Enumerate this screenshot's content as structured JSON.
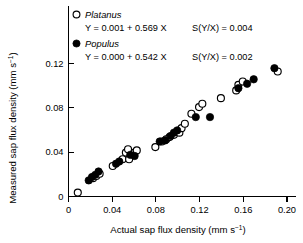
{
  "chart_data": {
    "type": "scatter",
    "title": "",
    "xlabel": "Actual sap flux density (mm s-1)",
    "xlabel_main": "Actual sap flux density (mm s",
    "xlabel_sup": "−1",
    "xlabel_tail": ")",
    "ylabel_main": "Measured sap flux density (mm s",
    "ylabel_sup": "−1",
    "ylabel_tail": ")",
    "xlim": [
      0,
      0.205
    ],
    "ylim": [
      0,
      0.14
    ],
    "xticks": [
      0,
      0.04,
      0.08,
      0.12,
      0.16,
      0.2
    ],
    "xtick_labels": [
      "0",
      "0.04",
      "0.08",
      "0.12",
      "0.16",
      "0.20"
    ],
    "yticks": [
      0,
      0.04,
      0.08,
      0.12
    ],
    "ytick_labels": [
      "0",
      "0.04",
      "0.08",
      "0.12"
    ],
    "grid": false,
    "legend_position": "top-left-inside",
    "series": [
      {
        "name": "Platanus",
        "marker": "open-circle",
        "color": "#000000",
        "fill": "#ffffff",
        "equation": "Y = 0.001 + 0.569 X",
        "intercept": 0.001,
        "slope": 0.569,
        "sy_x_label": "S(Y/X) = 0.004",
        "sy_x": 0.004,
        "points": [
          [
            0.0085,
            0.0035
          ],
          [
            0.0225,
            0.0165
          ],
          [
            0.0255,
            0.0185
          ],
          [
            0.0285,
            0.0205
          ],
          [
            0.0405,
            0.0275
          ],
          [
            0.0495,
            0.0335
          ],
          [
            0.0525,
            0.0395
          ],
          [
            0.0545,
            0.0425
          ],
          [
            0.0555,
            0.0335
          ],
          [
            0.0605,
            0.0395
          ],
          [
            0.0625,
            0.0415
          ],
          [
            0.0795,
            0.0445
          ],
          [
            0.0855,
            0.0495
          ],
          [
            0.0895,
            0.0515
          ],
          [
            0.0925,
            0.0535
          ],
          [
            0.0965,
            0.0555
          ],
          [
            0.1015,
            0.0575
          ],
          [
            0.1035,
            0.0615
          ],
          [
            0.1065,
            0.0655
          ],
          [
            0.1125,
            0.0745
          ],
          [
            0.1195,
            0.0805
          ],
          [
            0.1225,
            0.0835
          ],
          [
            0.1395,
            0.0885
          ],
          [
            0.1535,
            0.0955
          ],
          [
            0.1555,
            0.1005
          ],
          [
            0.1595,
            0.1035
          ],
          [
            0.1915,
            0.1125
          ]
        ]
      },
      {
        "name": "Populus",
        "marker": "filled-circle",
        "color": "#000000",
        "fill": "#000000",
        "equation": "Y = 0.000 + 0.542 X",
        "intercept": 0.0,
        "slope": 0.542,
        "sy_x_label": "S(Y/X) = 0.002",
        "sy_x": 0.002,
        "points": [
          [
            0.0185,
            0.0145
          ],
          [
            0.0215,
            0.0175
          ],
          [
            0.0245,
            0.0195
          ],
          [
            0.0275,
            0.0225
          ],
          [
            0.0435,
            0.0295
          ],
          [
            0.0465,
            0.0315
          ],
          [
            0.0565,
            0.0375
          ],
          [
            0.0605,
            0.0365
          ],
          [
            0.0835,
            0.0495
          ],
          [
            0.0885,
            0.0505
          ],
          [
            0.0935,
            0.0545
          ],
          [
            0.0965,
            0.0575
          ],
          [
            0.0995,
            0.0595
          ],
          [
            0.1165,
            0.0715
          ],
          [
            0.1295,
            0.0715
          ],
          [
            0.1555,
            0.0975
          ],
          [
            0.1635,
            0.1015
          ],
          [
            0.1695,
            0.1055
          ],
          [
            0.1885,
            0.1155
          ]
        ]
      }
    ]
  }
}
